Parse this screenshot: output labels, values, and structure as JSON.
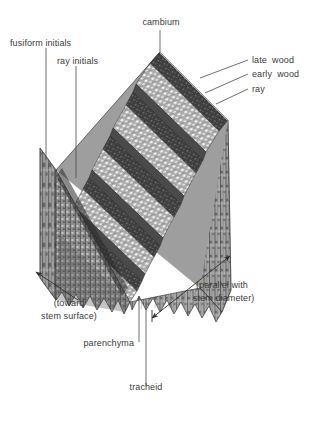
{
  "figure": {
    "background_color": "#ffffff",
    "label_color": "#3b3b3b",
    "leader_color": "#4a4a4a"
  },
  "labels": {
    "cambium": "cambium",
    "fusiform_initials": "fusiform initials",
    "ray_initials": "ray initials",
    "late_wood": "late  wood",
    "early_wood": "early  wood",
    "ray": "ray",
    "toward_stem_surface_line1": "(toward",
    "toward_stem_surface_line2": "stem surface)",
    "parallel_stem_diameter_line1": "(parallel with",
    "parallel_stem_diameter_line2": "stem diameter)",
    "parenchyma": "parenchyma",
    "tracheid": "tracheid"
  },
  "diagram": {
    "structure_type": "cut wood block, isometric",
    "top_surface": "transverse (cross) section with stepped growth-ring terraces",
    "left_face": "radial longitudinal section",
    "front_face": "transverse cellular section",
    "right_face": "tangential longitudinal section",
    "growth_rings": 5,
    "tones": {
      "late_wood_band": "#3a3a3a",
      "early_wood_band": "#b9b9b9",
      "left_face": "#8a8a8a",
      "right_face": "#9a9a9a",
      "front_face": "#8f8f8f",
      "outline": "#2e2e2e"
    }
  }
}
